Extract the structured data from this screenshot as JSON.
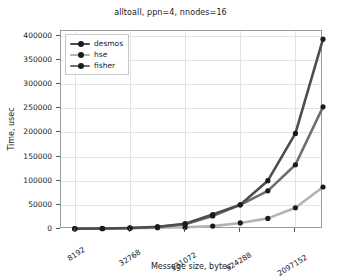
{
  "chart_data": {
    "type": "line",
    "title": "alltoall, ppn=4, nnodes=16",
    "xlabel": "Message size, bytes",
    "ylabel": "Time, usec",
    "xscale": "log2",
    "grid": true,
    "legend_position": "upper-left",
    "xlim": [
      5793,
      4194304
    ],
    "ylim": [
      0,
      410000
    ],
    "ytick_labels": [
      "400000",
      "350000",
      "300000",
      "250000",
      "200000",
      "150000",
      "100000",
      "50000",
      "0"
    ],
    "ytick_values": [
      400000,
      350000,
      300000,
      250000,
      200000,
      150000,
      100000,
      50000,
      0
    ],
    "xtick_labels": [
      "8192",
      "32768",
      "131072",
      "524288",
      "2097152"
    ],
    "xtick_values": [
      8192,
      32768,
      131072,
      524288,
      2097152
    ],
    "x": [
      8192,
      16384,
      32768,
      65536,
      131072,
      262144,
      524288,
      1048576,
      2097152,
      4194304
    ],
    "series": [
      {
        "name": "desmos",
        "color": "#4d4d4d",
        "marker": "circle",
        "marker_color": "#1b1b1b",
        "values": [
          600,
          1100,
          2200,
          4600,
          11000,
          30000,
          50000,
          100000,
          198000,
          393000
        ]
      },
      {
        "name": "hse",
        "color": "#b3b3b3",
        "marker": "circle",
        "marker_color": "#1b1b1b",
        "values": [
          400,
          700,
          1400,
          2600,
          3500,
          6000,
          12500,
          22000,
          44000,
          87000
        ]
      },
      {
        "name": "fisher",
        "color": "#6e6e6e",
        "marker": "circle",
        "marker_color": "#1b1b1b",
        "values": [
          500,
          1000,
          2000,
          4200,
          10000,
          27000,
          50000,
          79000,
          133000,
          253000
        ]
      }
    ]
  },
  "figure": {
    "background": "#ffffff",
    "axes_color": "#9a9a9a",
    "grid_color": "#e3e3e3"
  }
}
